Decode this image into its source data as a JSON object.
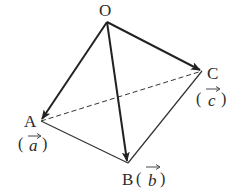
{
  "diagram": {
    "type": "tetrahedron-vectors",
    "vertices": {
      "O": {
        "x": 107,
        "y": 22,
        "label": "O"
      },
      "A": {
        "x": 41,
        "y": 121,
        "label": "A"
      },
      "B": {
        "x": 128,
        "y": 163,
        "label": "B"
      },
      "C": {
        "x": 202,
        "y": 71,
        "label": "C"
      }
    },
    "vector_labels": {
      "a": {
        "open": "(",
        "letter": "a",
        "close": ")"
      },
      "b": {
        "open": "(",
        "letter": "b",
        "close": ")"
      },
      "c": {
        "open": "(",
        "letter": "c",
        "close": ")"
      }
    },
    "edges": [
      {
        "from": "O",
        "to": "A",
        "style": "arrow-bold"
      },
      {
        "from": "O",
        "to": "B",
        "style": "arrow-bold"
      },
      {
        "from": "O",
        "to": "C",
        "style": "arrow-bold"
      },
      {
        "from": "A",
        "to": "B",
        "style": "solid"
      },
      {
        "from": "B",
        "to": "C",
        "style": "solid"
      },
      {
        "from": "A",
        "to": "C",
        "style": "dashed"
      }
    ],
    "colors": {
      "line": "#222222",
      "text": "#2a2a2a"
    }
  }
}
